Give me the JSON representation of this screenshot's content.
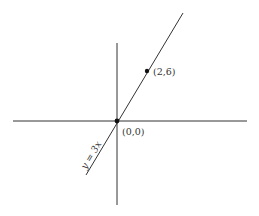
{
  "diagram": {
    "colors": {
      "background": "#ffffff",
      "stroke": "#333333",
      "point": "#111111"
    },
    "axes": {
      "x_axis": {
        "from": [
          13,
          121
        ],
        "to": [
          247,
          121
        ]
      },
      "y_axis": {
        "from": [
          117,
          43
        ],
        "to": [
          117,
          205
        ]
      }
    },
    "line": {
      "equation_label": "y = 3x",
      "from": [
        86,
        175
      ],
      "to": [
        183,
        13
      ]
    },
    "points": [
      {
        "label": "(0,0)",
        "px": [
          117,
          121
        ]
      },
      {
        "label": "(2,6)",
        "px": [
          147,
          71
        ]
      }
    ]
  }
}
